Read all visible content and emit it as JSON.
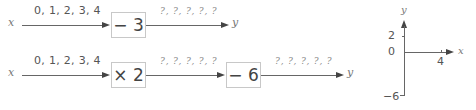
{
  "row1": {
    "input_var": "x",
    "input_values": "0, 1, 2, 3, 4",
    "operation": "− 3",
    "output_values": "?, ?, ?, ?, ?",
    "output_var": "y"
  },
  "row2": {
    "input_var": "x",
    "input_values": "0, 1, 2, 3, 4",
    "operation1": "× 2",
    "intermediate_values": "?, ?, ?, ?, ?",
    "operation2": "− 6",
    "output_values": "?, ?, ?, ?, ?",
    "output_var": "y"
  },
  "axes": {
    "x_label": "x",
    "y_label": "y",
    "y_ticks": [
      "2",
      "0",
      "−6"
    ],
    "x_ticks": [
      "4"
    ]
  }
}
